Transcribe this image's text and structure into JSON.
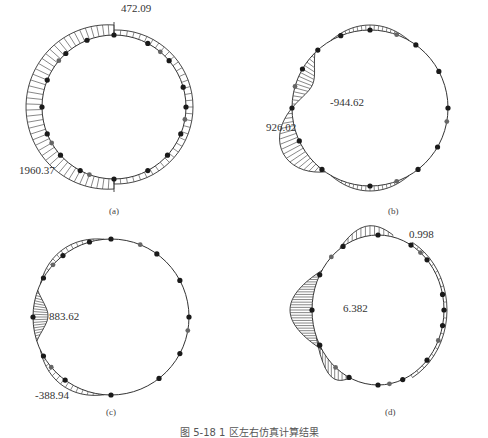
{
  "figure": {
    "caption": "图 5-18  1 区左右仿真计算结果",
    "panels": [
      {
        "id": "a",
        "label": "(a)",
        "values": [
          {
            "text": "472.09"
          },
          {
            "text": "1960.37"
          }
        ]
      },
      {
        "id": "b",
        "label": "(b)",
        "values": [
          {
            "text": "-944.62"
          },
          {
            "text": "926.02"
          }
        ]
      },
      {
        "id": "c",
        "label": "(c)",
        "values": [
          {
            "text": "883.62"
          },
          {
            "text": "-388.94"
          }
        ]
      },
      {
        "id": "d",
        "label": "(d)",
        "values": [
          {
            "text": "0.998"
          },
          {
            "text": "6.382"
          }
        ]
      }
    ]
  },
  "colors": {
    "line": "#333333",
    "node": "#1a1a1a",
    "node_grey": "#666666",
    "hatch": "#555555"
  }
}
